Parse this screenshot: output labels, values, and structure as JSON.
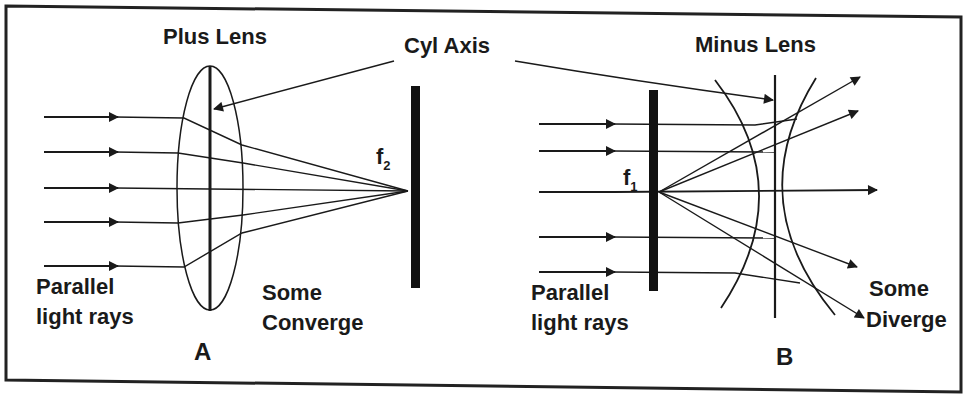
{
  "figure": {
    "frame_color": "#222222",
    "ink_color": "#1a1a1a",
    "shared_label": "Cyl Axis",
    "panel_a": {
      "id": "A",
      "title": "Plus Lens",
      "input_label_line1": "Parallel",
      "input_label_line2": "light rays",
      "output_label_line1": "Some",
      "output_label_line2": "Converge",
      "focal_label": "f",
      "focal_sub": "2",
      "ray_count": 5
    },
    "panel_b": {
      "id": "B",
      "title": "Minus Lens",
      "input_label_line1": "Parallel",
      "input_label_line2": "light rays",
      "output_label_line1": "Some",
      "output_label_line2": "Diverge",
      "focal_label": "f",
      "focal_sub": "1",
      "ray_count": 5
    }
  }
}
